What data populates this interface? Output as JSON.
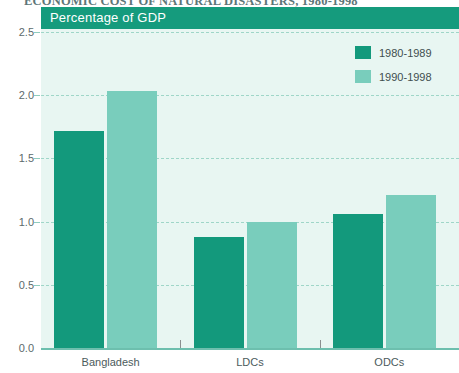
{
  "title": "ECONOMIC COST OF NATURAL DISASTERS, 1980-1998",
  "axis_caption": "Percentage of GDP",
  "colors": {
    "series_1980_1989": "#13997c",
    "series_1990_1998": "#79cdbc",
    "plot_background": "#e8f6f2",
    "header_band": "#159b7d",
    "gridline": "#9fd6c8"
  },
  "legend": {
    "position": "top-right",
    "entries": [
      {
        "label": "1980-1989",
        "color": "#13997c"
      },
      {
        "label": "1990-1998",
        "color": "#79cdbc"
      }
    ]
  },
  "chart_data": {
    "type": "bar",
    "title": "ECONOMIC COST OF NATURAL DISASTERS, 1980-1998",
    "subtitle": "",
    "xlabel": "",
    "ylabel": "Percentage of GDP",
    "categories": [
      "Bangladesh",
      "LDCs",
      "ODCs"
    ],
    "series": [
      {
        "name": "1980-1989",
        "color": "#13997c",
        "values": [
          1.72,
          0.88,
          1.06
        ]
      },
      {
        "name": "1990-1998",
        "color": "#79cdbc",
        "values": [
          2.03,
          1.0,
          1.21
        ]
      }
    ],
    "ylim": [
      0.0,
      2.5
    ],
    "yticks": [
      0.0,
      0.5,
      1.0,
      1.5,
      2.0,
      2.5
    ],
    "ytick_labels": [
      "0.0",
      "0.5",
      "1.0",
      "1.5",
      "2.0",
      "2.5"
    ],
    "grid": true,
    "grid_axis": "y",
    "grid_style": "dashed",
    "legend_position": "top-right"
  }
}
